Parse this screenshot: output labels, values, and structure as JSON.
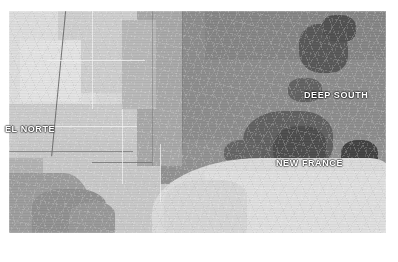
{
  "figure": {
    "type": "choropleth-map",
    "palette": "grayscale",
    "background_color": "#ffffff",
    "plate_background_color": "#cfcfcf"
  },
  "map": {
    "labels": [
      {
        "id": "el-norte",
        "text": "EL NORTE",
        "color": "#ffffff"
      },
      {
        "id": "deep-south",
        "text": "DEEP SOUTH",
        "color": "#ffffff"
      },
      {
        "id": "new-france",
        "text": "NEW FRANCE",
        "color": "#ffffff"
      }
    ],
    "regions": [
      {
        "name": "plains-northwest",
        "shade": "#d6d6d6"
      },
      {
        "name": "plains-west",
        "shade": "#dcdcdc"
      },
      {
        "name": "plains-mid",
        "shade": "#cdcdcd"
      },
      {
        "name": "plains-tan",
        "shade": "#e2e2e2"
      },
      {
        "name": "plains-lower",
        "shade": "#cacaca"
      },
      {
        "name": "plains-lower-light",
        "shade": "#c7c7c7"
      },
      {
        "name": "transition-band",
        "shade": "#a6a6a6"
      },
      {
        "name": "transition-band-2",
        "shade": "#b6b6b6"
      },
      {
        "name": "deep-south-core",
        "shade": "#8f8f8f"
      },
      {
        "name": "deep-south-core-2",
        "shade": "#8a8a8a"
      },
      {
        "name": "deep-south-upper",
        "shade": "#828282"
      },
      {
        "name": "black-belt-cluster",
        "shade": "#4a4a4a"
      },
      {
        "name": "gulf-of-mexico",
        "shade": "#d9d9d9"
      },
      {
        "name": "mexico-landmass",
        "shade": "#9a9a9a"
      }
    ],
    "boundaries": {
      "state_line_color": "#5c5c5c",
      "county_line_color": "#ffffff"
    }
  }
}
